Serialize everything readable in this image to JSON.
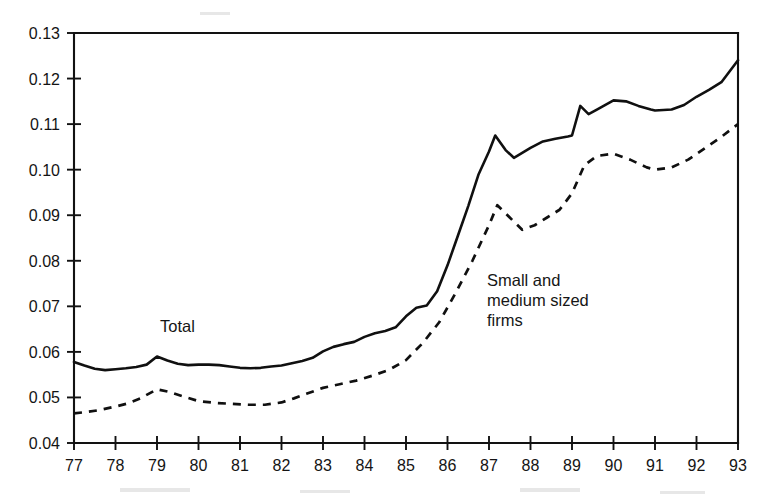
{
  "chart_data": {
    "type": "line",
    "title": "",
    "subtitle": "",
    "xlabel": "",
    "ylabel": "",
    "grid": false,
    "legend_position": "inline-annotation",
    "x": [
      77,
      78,
      79,
      80,
      81,
      82,
      83,
      84,
      85,
      86,
      87,
      88,
      89,
      90,
      91,
      92,
      93
    ],
    "x_tick_labels": [
      "77",
      "78",
      "79",
      "80",
      "81",
      "82",
      "83",
      "84",
      "85",
      "86",
      "87",
      "88",
      "89",
      "90",
      "91",
      "92",
      "93"
    ],
    "y_tick_labels": [
      "0.04",
      "0.05",
      "0.06",
      "0.07",
      "0.08",
      "0.09",
      "0.10",
      "0.11",
      "0.12",
      "0.13"
    ],
    "y_tick_values": [
      0.04,
      0.05,
      0.06,
      0.07,
      0.08,
      0.09,
      0.1,
      0.11,
      0.12,
      0.13
    ],
    "xlim": [
      77,
      93
    ],
    "ylim": [
      0.04,
      0.13
    ],
    "series": [
      {
        "name": "Total",
        "style": "solid",
        "label_text": "Total",
        "points": [
          [
            77.0,
            0.0578
          ],
          [
            77.25,
            0.057
          ],
          [
            77.5,
            0.0563
          ],
          [
            77.75,
            0.056
          ],
          [
            78.0,
            0.0562
          ],
          [
            78.25,
            0.0564
          ],
          [
            78.5,
            0.0567
          ],
          [
            78.75,
            0.0572
          ],
          [
            79.0,
            0.059
          ],
          [
            79.25,
            0.0581
          ],
          [
            79.5,
            0.0574
          ],
          [
            79.75,
            0.0571
          ],
          [
            80.0,
            0.0572
          ],
          [
            80.25,
            0.0572
          ],
          [
            80.5,
            0.0571
          ],
          [
            80.75,
            0.0568
          ],
          [
            81.0,
            0.0565
          ],
          [
            81.25,
            0.0564
          ],
          [
            81.5,
            0.0565
          ],
          [
            81.75,
            0.0568
          ],
          [
            82.0,
            0.057
          ],
          [
            82.25,
            0.0575
          ],
          [
            82.5,
            0.058
          ],
          [
            82.75,
            0.0587
          ],
          [
            83.0,
            0.0601
          ],
          [
            83.25,
            0.0611
          ],
          [
            83.5,
            0.0617
          ],
          [
            83.75,
            0.0622
          ],
          [
            84.0,
            0.0633
          ],
          [
            84.25,
            0.0641
          ],
          [
            84.5,
            0.0646
          ],
          [
            84.75,
            0.0654
          ],
          [
            85.0,
            0.0678
          ],
          [
            85.25,
            0.0697
          ],
          [
            85.5,
            0.0702
          ],
          [
            85.75,
            0.0733
          ],
          [
            86.0,
            0.079
          ],
          [
            86.25,
            0.0855
          ],
          [
            86.5,
            0.092
          ],
          [
            86.75,
            0.099
          ],
          [
            87.0,
            0.104
          ],
          [
            87.15,
            0.1075
          ],
          [
            87.4,
            0.1043
          ],
          [
            87.6,
            0.1026
          ],
          [
            88.0,
            0.1048
          ],
          [
            88.3,
            0.1062
          ],
          [
            88.6,
            0.1068
          ],
          [
            88.9,
            0.1073
          ],
          [
            89.0,
            0.1075
          ],
          [
            89.2,
            0.114
          ],
          [
            89.4,
            0.1122
          ],
          [
            89.6,
            0.1132
          ],
          [
            90.0,
            0.1152
          ],
          [
            90.3,
            0.115
          ],
          [
            90.6,
            0.114
          ],
          [
            90.9,
            0.1132
          ],
          [
            91.0,
            0.113
          ],
          [
            91.4,
            0.1132
          ],
          [
            91.7,
            0.1142
          ],
          [
            92.0,
            0.116
          ],
          [
            92.3,
            0.1175
          ],
          [
            92.6,
            0.1192
          ],
          [
            93.0,
            0.124
          ]
        ]
      },
      {
        "name": "Small and medium sized firms",
        "style": "dashed",
        "label_text": "Small and\nmedium sized\nfirms",
        "label_lines": [
          "Small and",
          "medium sized",
          "firms"
        ],
        "points": [
          [
            77.0,
            0.0465
          ],
          [
            77.3,
            0.0468
          ],
          [
            77.6,
            0.0472
          ],
          [
            78.0,
            0.048
          ],
          [
            78.3,
            0.0487
          ],
          [
            78.6,
            0.0498
          ],
          [
            79.0,
            0.0518
          ],
          [
            79.3,
            0.0512
          ],
          [
            79.6,
            0.0503
          ],
          [
            80.0,
            0.0492
          ],
          [
            80.4,
            0.0488
          ],
          [
            80.8,
            0.0486
          ],
          [
            81.2,
            0.0484
          ],
          [
            81.6,
            0.0484
          ],
          [
            82.0,
            0.0489
          ],
          [
            82.3,
            0.0498
          ],
          [
            82.6,
            0.0508
          ],
          [
            83.0,
            0.0521
          ],
          [
            83.4,
            0.0529
          ],
          [
            83.8,
            0.0537
          ],
          [
            84.2,
            0.0548
          ],
          [
            84.6,
            0.0561
          ],
          [
            85.0,
            0.0582
          ],
          [
            85.4,
            0.0619
          ],
          [
            85.8,
            0.0665
          ],
          [
            86.2,
            0.073
          ],
          [
            86.6,
            0.08
          ],
          [
            87.0,
            0.0878
          ],
          [
            87.2,
            0.0922
          ],
          [
            87.5,
            0.0895
          ],
          [
            87.8,
            0.0868
          ],
          [
            88.1,
            0.0878
          ],
          [
            88.4,
            0.0895
          ],
          [
            88.7,
            0.0912
          ],
          [
            89.0,
            0.0948
          ],
          [
            89.3,
            0.101
          ],
          [
            89.6,
            0.103
          ],
          [
            90.0,
            0.1035
          ],
          [
            90.4,
            0.1022
          ],
          [
            90.8,
            0.1005
          ],
          [
            91.0,
            0.1
          ],
          [
            91.4,
            0.1005
          ],
          [
            91.8,
            0.1022
          ],
          [
            92.2,
            0.1047
          ],
          [
            92.6,
            0.1072
          ],
          [
            93.0,
            0.11
          ]
        ]
      }
    ],
    "annotations": [
      {
        "name": "total-annotation",
        "text": "Total",
        "x_px": 160,
        "y_px": 332
      },
      {
        "name": "small-medium-annotation-line-1",
        "text": "Small and",
        "x_px": 487,
        "y_px": 286
      },
      {
        "name": "small-medium-annotation-line-2",
        "text": "medium sized",
        "x_px": 487,
        "y_px": 306
      },
      {
        "name": "small-medium-annotation-line-3",
        "text": "firms",
        "x_px": 487,
        "y_px": 326
      }
    ]
  },
  "colors": {
    "line": "#101010",
    "axis": "#121212",
    "text": "#141414",
    "background": "#ffffff"
  }
}
